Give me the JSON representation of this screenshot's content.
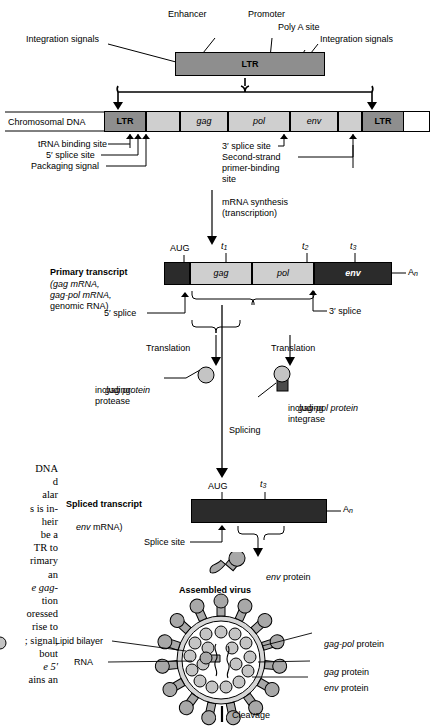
{
  "figure": {
    "ltr_element": {
      "box_label": "LTR",
      "annotations": [
        "Integration signals",
        "Enhancer",
        "Promoter",
        "Poly A site",
        "Integration signals"
      ]
    },
    "chromosomal_dna": {
      "row_label": "Chromosomal DNA",
      "segments": [
        {
          "label": "LTR",
          "kind": "ltr"
        },
        {
          "label": "",
          "kind": "spacer"
        },
        {
          "label": "gag",
          "kind": "gene"
        },
        {
          "label": "pol",
          "kind": "gene"
        },
        {
          "label": "env",
          "kind": "gene"
        },
        {
          "label": "",
          "kind": "spacer"
        },
        {
          "label": "LTR",
          "kind": "ltr"
        }
      ],
      "left_callouts": [
        "tRNA binding site",
        "5′ splice site",
        "Packaging signal"
      ],
      "right_callouts": [
        "3′ splice site",
        "Second-strand",
        "primer-binding",
        "site"
      ]
    },
    "transcription_step": {
      "line1": "mRNA synthesis",
      "line2": "(transcription)"
    },
    "primary_transcript": {
      "title": "Primary transcript",
      "sub_lines": [
        "(gag mRNA,",
        "gag-pol mRNA,",
        "genomic RNA)"
      ],
      "tick_marks": [
        "AUG",
        "t1",
        "t2",
        "t3"
      ],
      "poly_a": "An",
      "splice_left": "5′ splice",
      "splice_right": "3′ splice",
      "genes": [
        "gag",
        "pol",
        "env"
      ]
    },
    "translation": {
      "left_label": "Translation",
      "right_label": "Translation",
      "gag_protein_lines": [
        "gag protein",
        "including",
        "protease"
      ],
      "gagpol_protein_lines": [
        "gag-pol protein",
        "including",
        "integrase"
      ]
    },
    "splicing_step": {
      "label": "Splicing"
    },
    "spliced_transcript": {
      "title": "Spliced transcript",
      "sub": "(env mRNA)",
      "tick_marks": [
        "AUG",
        "t3"
      ],
      "poly_a": "An",
      "splice_site": "Splice site",
      "product": "env protein"
    },
    "assembled_virus": {
      "title": "Assembled virus",
      "left_labels": [
        "Lipid bilayer",
        "RNA"
      ],
      "right_labels": [
        "gag-pol protein",
        "gag protein",
        "env protein"
      ]
    },
    "cleavage_step": {
      "label": "Cleavage"
    },
    "margin_text_fragments": [
      "DNA",
      "d",
      "alar",
      "s is in-",
      "heir",
      "be a",
      "TR to",
      "rimary",
      "an",
      "e gag-",
      "tion",
      "oressed",
      "rise to",
      "; signal,",
      "bout",
      "e 5′",
      "ains an"
    ]
  },
  "colors": {
    "ltr_fill": "#8e8e8e",
    "gene_fill": "#cfcfcf",
    "dark_fill": "#2b2b2b",
    "protein_fill": "#a8a8a8",
    "stroke": "#000000"
  }
}
